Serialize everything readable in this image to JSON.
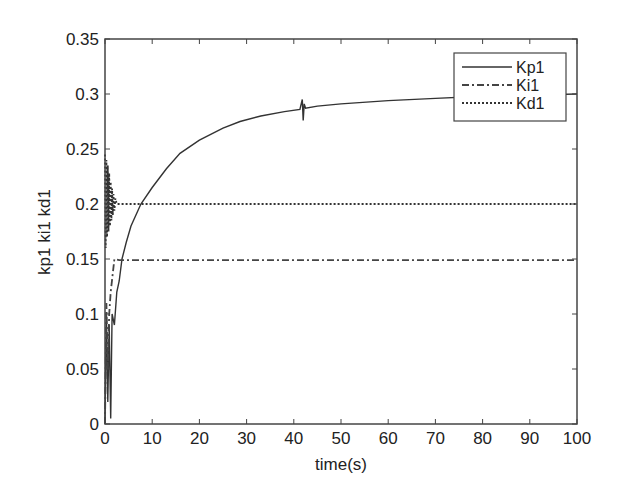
{
  "chart_data": {
    "type": "line",
    "title": "",
    "xlabel": "time(s)",
    "ylabel": "kp1 ki1 kd1",
    "xlim": [
      0,
      100
    ],
    "ylim": [
      0,
      0.35
    ],
    "xticks": [
      0,
      10,
      20,
      30,
      40,
      50,
      60,
      70,
      80,
      90,
      100
    ],
    "xtick_labels": [
      "0",
      "10",
      "20",
      "30",
      "40",
      "50",
      "60",
      "70",
      "80",
      "90",
      "100"
    ],
    "yticks": [
      0,
      0.05,
      0.1,
      0.15,
      0.2,
      0.25,
      0.3,
      0.35
    ],
    "ytick_labels": [
      "0",
      "0.05",
      "0.1",
      "0.15",
      "0.2",
      "0.25",
      "0.3",
      "0.35"
    ],
    "grid": false,
    "legend_position": "upper right",
    "legend": [
      "Kp1",
      "Ki1",
      "Kd1"
    ],
    "series": [
      {
        "name": "Kp1",
        "style": "solid",
        "color": "#333333",
        "x": [
          0,
          0.3,
          0.6,
          0.9,
          1.2,
          1.5,
          2,
          2.5,
          3,
          3.6,
          4.5,
          5.5,
          7.6,
          10,
          13,
          15.9,
          20,
          25,
          28.6,
          33,
          38,
          41.3,
          41.8,
          42,
          42.2,
          42.5,
          45,
          50,
          60,
          70,
          80,
          90,
          100
        ],
        "y": [
          0.0,
          0.1,
          0.02,
          0.09,
          0.005,
          0.1,
          0.09,
          0.12,
          0.13,
          0.15,
          0.165,
          0.18,
          0.2,
          0.215,
          0.232,
          0.246,
          0.258,
          0.269,
          0.275,
          0.28,
          0.284,
          0.286,
          0.295,
          0.276,
          0.291,
          0.287,
          0.289,
          0.291,
          0.294,
          0.296,
          0.298,
          0.299,
          0.3
        ]
      },
      {
        "name": "Ki1",
        "style": "dashdot",
        "color": "#444444",
        "x": [
          0,
          0.3,
          0.6,
          0.9,
          1.2,
          2,
          3,
          100
        ],
        "y": [
          0.0,
          0.11,
          0.05,
          0.1,
          0.12,
          0.15,
          0.149,
          0.149
        ]
      },
      {
        "name": "Kd1",
        "style": "dotted",
        "color": "#333333",
        "x": [
          0,
          0.15,
          0.3,
          0.45,
          0.6,
          0.75,
          0.9,
          1.05,
          1.2,
          1.35,
          1.5,
          1.65,
          1.8,
          2.0,
          2.2,
          2.5,
          100
        ],
        "y": [
          0.245,
          0.16,
          0.24,
          0.17,
          0.235,
          0.175,
          0.228,
          0.18,
          0.22,
          0.185,
          0.214,
          0.19,
          0.209,
          0.194,
          0.205,
          0.2,
          0.2
        ]
      }
    ],
    "annotations": []
  },
  "layout": {
    "plot_left": 105,
    "plot_top": 39,
    "plot_right": 577,
    "plot_bottom": 424
  }
}
